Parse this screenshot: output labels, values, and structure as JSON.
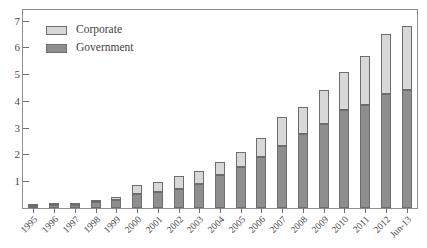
{
  "chart_data": {
    "type": "bar",
    "stacked": true,
    "title": "",
    "subtitle": "",
    "xlabel": "",
    "ylabel": "",
    "ylim": [
      0,
      7.4
    ],
    "ytick_labels": [
      "1",
      "2",
      "3",
      "4",
      "5",
      "6",
      "7"
    ],
    "yticks": [
      1,
      2,
      3,
      4,
      5,
      6,
      7
    ],
    "grid": false,
    "legend_position": "upper-left",
    "categories": [
      "1995",
      "1996",
      "1997",
      "1998",
      "1999",
      "2000",
      "2001",
      "2002",
      "2003",
      "2004",
      "2005",
      "2006",
      "2007",
      "2008",
      "2009",
      "2010",
      "2011",
      "2012",
      "Jun-13"
    ],
    "series": [
      {
        "name": "Government",
        "color": "#8e8e8e",
        "values": [
          0.08,
          0.11,
          0.13,
          0.24,
          0.31,
          0.52,
          0.58,
          0.72,
          0.9,
          1.22,
          1.52,
          1.92,
          2.32,
          2.75,
          3.15,
          3.65,
          3.85,
          4.25,
          4.4
        ]
      },
      {
        "name": "Corporate",
        "color": "#d8d8d8",
        "values": [
          0.03,
          0.04,
          0.05,
          0.07,
          0.12,
          0.33,
          0.39,
          0.46,
          0.47,
          0.5,
          0.58,
          0.7,
          1.08,
          1.03,
          1.25,
          1.45,
          1.85,
          2.25,
          2.4
        ]
      }
    ],
    "totals": [
      0.11,
      0.15,
      0.18,
      0.31,
      0.43,
      0.85,
      0.97,
      1.18,
      1.37,
      1.72,
      2.1,
      2.62,
      3.4,
      3.78,
      4.4,
      5.1,
      5.7,
      6.5,
      6.8
    ]
  },
  "legend": {
    "items": [
      {
        "label": "Corporate",
        "swatch": "corp"
      },
      {
        "label": "Government",
        "swatch": "gov"
      }
    ]
  },
  "colors": {
    "corporate": "#d8d8d8",
    "government": "#8e8e8e",
    "axis": "#8e8e8e",
    "text": "#4a4a4a",
    "background": "#ffffff"
  }
}
